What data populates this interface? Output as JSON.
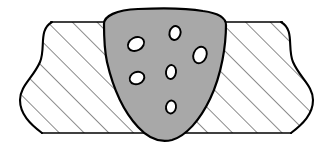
{
  "figure": {
    "width": 330,
    "height": 146,
    "background_color": "#FFFFFF"
  },
  "colors": {
    "outline": "#000000",
    "weld_fill": "#A8A8A8",
    "plate_fill": "#FFFFFF",
    "hatch_line": "#000000",
    "void_fill": "#FFFFFF",
    "void_outline": "#000000"
  },
  "plate": {
    "label": "base-metal-plate",
    "top_edge_y": 22,
    "bottom_edge_y": 133,
    "left_break_x": 14,
    "right_break_x": 316,
    "outline_width": 1.6,
    "hatch": {
      "label": "section-hatching",
      "angle_deg": 45,
      "spacing_px": 17.5,
      "stroke_width": 0.9,
      "direction": "up-right"
    },
    "left_break": {
      "label": "conventional-break-line-left",
      "shape": "s-curve",
      "path": "M 88 22 L 52 22 C 38 30 46 48 40 62 C 33 78 20 86 20 100 C 20 114 30 124 42 133 L 88 133"
    },
    "right_break": {
      "label": "conventional-break-line-right",
      "shape": "s-curve",
      "path": "M 238 22 L 281 22 C 295 30 287 48 293 62 C 300 78 313 86 313 100 C 313 114 303 124 291 133 L 238 133"
    }
  },
  "weld_bead": {
    "label": "weld-bead-deposit",
    "description": "Rounded-triangular weld nugget spanning the plate thickness",
    "fill": "#A8A8A8",
    "outline_width": 2.2,
    "crown_top_y": 10,
    "root_bottom_y": 141,
    "left_toe_x": 97,
    "right_toe_x": 228,
    "path": "M 104 24 C 104 16 116 10 138 9 C 160 8 186 8 203 11 C 218 13 226 18 226 25 C 226 44 222 74 210 99 C 200 120 186 136 172 140 C 160 143 148 138 138 127 C 124 112 113 88 107 62 C 104 48 104 34 104 24 Z"
  },
  "porosity_voids": {
    "label": "porosity-voids",
    "count": 6,
    "items": [
      {
        "id": "void-1",
        "cx": 136,
        "cy": 44,
        "rx": 8.5,
        "ry": 6.5,
        "rotation": -28
      },
      {
        "id": "void-2",
        "cx": 175,
        "cy": 33,
        "rx": 5.5,
        "ry": 7.0,
        "rotation": 14
      },
      {
        "id": "void-3",
        "cx": 200,
        "cy": 55,
        "rx": 6.5,
        "ry": 8.5,
        "rotation": 22
      },
      {
        "id": "void-4",
        "cx": 171,
        "cy": 72,
        "rx": 5.0,
        "ry": 7.0,
        "rotation": 8
      },
      {
        "id": "void-5",
        "cx": 137,
        "cy": 78,
        "rx": 7.5,
        "ry": 6.0,
        "rotation": -22
      },
      {
        "id": "void-6",
        "cx": 171,
        "cy": 107,
        "rx": 5.0,
        "ry": 6.5,
        "rotation": 10
      }
    ]
  }
}
